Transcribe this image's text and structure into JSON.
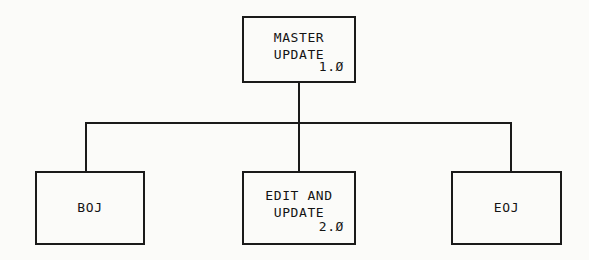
{
  "diagram": {
    "type": "structure-chart",
    "nodes": {
      "master": {
        "label": "MASTER\nUPDATE",
        "id": "1.Ø"
      },
      "boj": {
        "label": "BOJ"
      },
      "edit": {
        "label": "EDIT AND\nUPDATE",
        "id": "2.Ø"
      },
      "eoj": {
        "label": "EOJ"
      }
    },
    "colors": {
      "line": "#1a1a1a",
      "text": "#141414",
      "background": "#fbfbf9"
    }
  }
}
